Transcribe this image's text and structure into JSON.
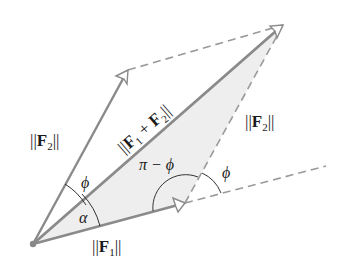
{
  "diagram": {
    "type": "vector-parallelogram",
    "colors": {
      "vector_line": "#8a8a8a",
      "dashed_line": "#9a9a9a",
      "triangle_fill": "#eeeeee",
      "arc": "#333333",
      "text": "#1a1a1a",
      "origin_dot": "#888888"
    },
    "points": {
      "origin": [
        33,
        244
      ],
      "f1_tip": [
        185,
        203
      ],
      "f2_tip": [
        128,
        70
      ],
      "resultant_tip": [
        283,
        25
      ],
      "extension_end": [
        326,
        166
      ]
    },
    "labels": {
      "f1_magnitude": {
        "pre": "||",
        "main": "F",
        "sub": "1",
        "post": "||"
      },
      "f2_magnitude_left": {
        "pre": "||",
        "main": "F",
        "sub": "2",
        "post": "||"
      },
      "f2_magnitude_right": {
        "pre": "||",
        "main": "F",
        "sub": "2",
        "post": "||"
      },
      "resultant_magnitude": {
        "pre": "||",
        "main1": "F",
        "sub1": "1",
        "plus": " + ",
        "main2": "F",
        "sub2": "2",
        "post": "||"
      },
      "angle_phi_origin": "ϕ",
      "angle_alpha": "α",
      "angle_pi_minus_phi": "π − ϕ",
      "angle_phi_exterior": "ϕ"
    }
  }
}
